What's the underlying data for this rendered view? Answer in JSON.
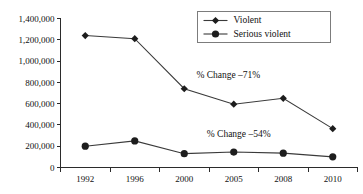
{
  "chart_data": {
    "type": "line",
    "title": "",
    "subtitle": "",
    "xlabel": "",
    "ylabel": "",
    "categories": [
      "1992",
      "1996",
      "2000",
      "2005",
      "2008",
      "2010"
    ],
    "series": [
      {
        "name": "Violent",
        "marker": "diamond",
        "color": "#1d1d1d",
        "values": [
          1240000,
          1210000,
          740000,
          595000,
          650000,
          365000
        ]
      },
      {
        "name": "Serious violent",
        "marker": "circle",
        "color": "#1d1d1d",
        "values": [
          200000,
          250000,
          130000,
          145000,
          135000,
          100000
        ]
      }
    ],
    "ylim": [
      0,
      1400000
    ],
    "ytick_values": [
      0,
      200000,
      400000,
      600000,
      800000,
      1000000,
      1200000,
      1400000
    ],
    "ytick_labels": [
      "0",
      "200,000",
      "400,000",
      "600,000",
      "800,000",
      "1,000,000",
      "1,200,000",
      "1,400,000"
    ],
    "grid": false,
    "legend_position": "top-right",
    "annotations": [
      {
        "text": "% Change –71%",
        "series": "Violent",
        "x_fraction": 0.565,
        "value": 840000
      },
      {
        "text": "% Change –54%",
        "series": "Serious violent",
        "x_fraction": 0.6,
        "value": 290000
      }
    ]
  },
  "legend": {
    "entries": [
      {
        "label": "Violent",
        "marker": "diamond"
      },
      {
        "label": "Serious violent",
        "marker": "circle"
      }
    ]
  }
}
